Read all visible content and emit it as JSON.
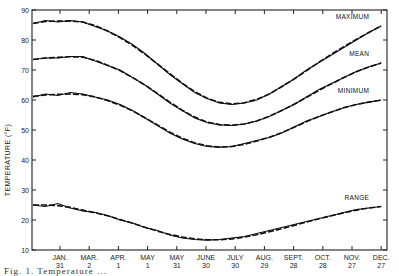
{
  "chart_data": {
    "type": "line",
    "title": "",
    "xlabel": "",
    "ylabel": "TEMPERATURE (°F)",
    "ylim": [
      10,
      90
    ],
    "yticks": [
      10,
      20,
      30,
      40,
      50,
      60,
      70,
      80,
      90
    ],
    "grid": false,
    "legend": "inline labels at right end of each curve",
    "x_tick_labels": [
      {
        "month": "JAN.",
        "day": "31"
      },
      {
        "month": "MAR.",
        "day": "2"
      },
      {
        "month": "APR.",
        "day": "1"
      },
      {
        "month": "MAY",
        "day": "1"
      },
      {
        "month": "MAY",
        "day": "31"
      },
      {
        "month": "JUNE",
        "day": "30"
      },
      {
        "month": "JULY",
        "day": "30"
      },
      {
        "month": "AUG.",
        "day": "29"
      },
      {
        "month": "SEPT.",
        "day": "28"
      },
      {
        "month": "OCT.",
        "day": "28"
      },
      {
        "month": "NOV.",
        "day": "27"
      },
      {
        "month": "DEC.",
        "day": "27"
      }
    ],
    "x_positions_note": "x index 0 = start (early Jan), 1..12 = tick labels above",
    "x": [
      0,
      0.5,
      1,
      1.5,
      2,
      2.5,
      3,
      3.5,
      4,
      4.5,
      5,
      5.5,
      6,
      6.5,
      7,
      7.5,
      8,
      8.5,
      9,
      9.5,
      10,
      10.5,
      11,
      11.5,
      12
    ],
    "series": [
      {
        "name": "MAXIMUM",
        "observed": [
          85.5,
          86.5,
          86,
          86.5,
          86,
          84.5,
          83,
          81,
          78.5,
          75.5,
          72,
          68.5,
          65.5,
          62.5,
          60.5,
          59,
          58.5,
          59,
          60,
          62,
          64.5,
          67,
          70,
          72.5,
          75,
          77.5,
          80,
          82.5,
          84.7
        ],
        "smoothed": [
          85.5,
          86.2,
          86.3,
          86.3,
          86,
          84.8,
          83,
          80.8,
          78.2,
          75.3,
          72,
          68.8,
          65.6,
          62.8,
          60.6,
          59.2,
          58.7,
          59.1,
          60.2,
          62,
          64.4,
          67,
          69.8,
          72.6,
          75.3,
          77.8,
          80.2,
          82.5,
          84.7
        ]
      },
      {
        "name": "MEAN",
        "observed": [
          73.5,
          74,
          74,
          74.5,
          74.5,
          73,
          71.5,
          70,
          67.5,
          65,
          62,
          59,
          56.5,
          54,
          52.5,
          51.7,
          51.5,
          52,
          53,
          54.5,
          56.5,
          58.5,
          61,
          63.5,
          65.5,
          67.5,
          69.5,
          71,
          72.3
        ],
        "smoothed": [
          73.5,
          74,
          74.2,
          74.4,
          74.3,
          73.2,
          71.6,
          69.8,
          67.5,
          65,
          62.2,
          59.3,
          56.6,
          54.3,
          52.6,
          51.8,
          51.6,
          52,
          53,
          54.6,
          56.5,
          58.6,
          60.9,
          63.2,
          65.4,
          67.5,
          69.4,
          71,
          72.3
        ]
      },
      {
        "name": "MINIMUM",
        "observed": [
          61,
          62,
          61.5,
          62.5,
          62,
          61,
          60,
          58.5,
          56.5,
          54,
          51.5,
          49,
          47,
          45.5,
          44.5,
          44.3,
          44.5,
          45.5,
          46.5,
          47.5,
          49,
          51,
          53,
          54.5,
          56,
          57.5,
          58.5,
          59.3,
          60
        ],
        "smoothed": [
          61.2,
          61.7,
          61.9,
          62,
          61.8,
          61,
          59.8,
          58.3,
          56.4,
          54.1,
          51.7,
          49.3,
          47.3,
          45.7,
          44.7,
          44.3,
          44.5,
          45.2,
          46.3,
          47.6,
          49.1,
          50.9,
          52.8,
          54.5,
          56,
          57.4,
          58.5,
          59.3,
          60
        ]
      },
      {
        "name": "RANGE",
        "observed": [
          25,
          24.5,
          25.5,
          24,
          23,
          22.5,
          21.5,
          20,
          19,
          17.5,
          16.5,
          15,
          14,
          13.5,
          13.3,
          13.5,
          14,
          14.5,
          15.5,
          16.5,
          17.5,
          18.5,
          19.5,
          20.5,
          21.5,
          22.5,
          23.5,
          24,
          24.5
        ],
        "smoothed": [
          25,
          25,
          24.8,
          24.2,
          23.3,
          22.4,
          21.4,
          20.2,
          18.9,
          17.6,
          16.3,
          15.2,
          14.3,
          13.7,
          13.4,
          13.4,
          13.7,
          14.3,
          15.1,
          16.1,
          17.1,
          18.2,
          19.3,
          20.4,
          21.4,
          22.4,
          23.3,
          24,
          24.5
        ]
      }
    ]
  },
  "labels": {
    "y_axis_title": "TEMPERATURE (°F)",
    "series_labels": [
      "MAXIMUM",
      "MEAN",
      "MINIMUM",
      "RANGE"
    ],
    "caption": "Fig. 1.   Temperature   ..."
  }
}
